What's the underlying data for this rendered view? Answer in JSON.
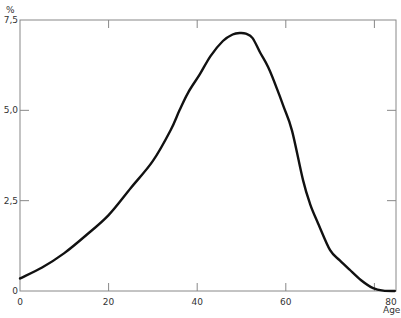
{
  "chart_data": {
    "type": "line",
    "title": "",
    "xlabel": "Age",
    "ylabel": "%",
    "xlim": [
      0,
      85
    ],
    "ylim": [
      0,
      7.5
    ],
    "x_ticks": [
      0,
      20,
      40,
      60,
      80
    ],
    "x_tick_labels": [
      "0",
      "20",
      "40",
      "60",
      "80"
    ],
    "y_ticks": [
      0,
      2.5,
      5.0,
      7.5
    ],
    "y_tick_labels": [
      "0",
      "2,5",
      "5,0",
      "7,5"
    ],
    "grid": false,
    "legend": null,
    "series": [
      {
        "name": "distribution",
        "color": "#111111",
        "x": [
          0,
          5,
          10,
          15,
          20,
          25,
          30,
          34,
          36,
          38,
          40.6,
          43,
          45.8,
          48,
          49.7,
          51,
          52.5,
          54.2,
          56,
          58,
          59.5,
          61.4,
          63.9,
          65.5,
          67.3,
          70,
          72.2,
          74.5,
          77,
          79.7,
          82,
          84.6
        ],
        "y": [
          0.35,
          0.65,
          1.05,
          1.55,
          2.1,
          2.85,
          3.6,
          4.45,
          5.0,
          5.5,
          6.0,
          6.5,
          6.92,
          7.1,
          7.14,
          7.12,
          7.0,
          6.6,
          6.2,
          5.6,
          5.1,
          4.44,
          3.06,
          2.4,
          1.87,
          1.13,
          0.85,
          0.58,
          0.3,
          0.08,
          0.01,
          0.0
        ]
      }
    ]
  },
  "axes": {
    "y_unit": "%",
    "x_name": "Age",
    "y_labels": [
      "0",
      "2,5",
      "5,0",
      "7,5"
    ],
    "x_labels": [
      "0",
      "20",
      "40",
      "60",
      "80"
    ]
  }
}
